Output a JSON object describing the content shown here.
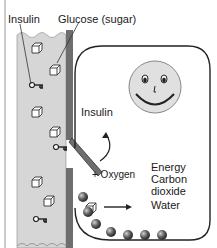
{
  "labels": {
    "insulin_top": "Insulin",
    "glucose": "Glucose (sugar)",
    "insulin_door": "Insulin",
    "plus_oxygen": "+ Oxygen",
    "products": [
      "Energy",
      "Carbon",
      "dioxide",
      "Water"
    ]
  },
  "colors": {
    "blood_vessel": "#d4d4d4",
    "vessel_wall": "#6e6e6e",
    "face": "#e0e0e0",
    "outline": "#222222",
    "ball": "#555555"
  },
  "counts": {
    "glucose_cubes_in_vessel": 6,
    "insulin_keys": 4,
    "storage_balls": 7
  }
}
